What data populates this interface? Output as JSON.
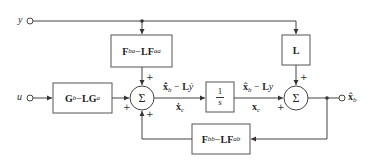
{
  "diagram": {
    "type": "block-diagram",
    "title": "",
    "inputs": {
      "y": "y",
      "u": "u"
    },
    "output": {
      "label_main": "x̂",
      "label_sub": "b"
    },
    "blocks": {
      "fba_block": {
        "left": "F",
        "left_sub": "ba",
        "op": " − ",
        "right": "LF",
        "right_sub": "aa"
      },
      "gb_block": {
        "left": "G",
        "left_sub": "b",
        "op": " − ",
        "right": "LG",
        "right_sub": "a"
      },
      "integrator_block": {
        "num": "1",
        "den": "s"
      },
      "l_block": {
        "label": "L"
      },
      "fbb_block": {
        "left": "F",
        "left_sub": "bb",
        "op": " − ",
        "right": "LF",
        "right_sub": "ab"
      }
    },
    "summing_junctions": {
      "sum1": {
        "symbol": "Σ",
        "signs": [
          "+",
          "+",
          "+"
        ]
      },
      "sum2": {
        "symbol": "Σ",
        "signs": [
          "+",
          "+"
        ]
      }
    },
    "signals": {
      "sum1_out_top": {
        "a": "x̂̇",
        "a_sub": "b",
        "op": " − ",
        "b": "L",
        "c": "ẏ"
      },
      "sum1_out_bottom": {
        "a": "ẋ",
        "a_sub": "c"
      },
      "int_out_top": {
        "a": "x̂",
        "a_sub": "b",
        "op": " − ",
        "b": "L",
        "c": "y"
      },
      "int_out_bottom": {
        "a": "x",
        "a_sub": "c"
      }
    },
    "colors": {
      "line": "#444444",
      "box_border": "#555555",
      "background": "#ffffff"
    }
  }
}
